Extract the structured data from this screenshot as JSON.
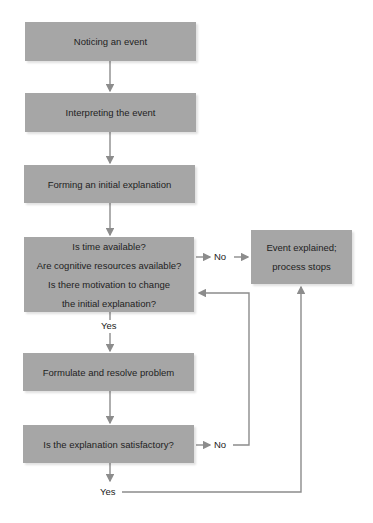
{
  "diagram": {
    "type": "flowchart",
    "nodes": {
      "notice": "Noticing an event",
      "interpret": "Interpreting the event",
      "initial": "Forming an initial explanation",
      "decision": [
        "Is time available?",
        "Are cognitive resources available?",
        "Is there motivation to change",
        "the initial explanation?"
      ],
      "formulate": "Formulate and resolve problem",
      "satisfactory": "Is the explanation satisfactory?",
      "explained": [
        "Event explained;",
        "process stops"
      ]
    },
    "labels": {
      "decision_no": "No",
      "decision_yes": "Yes",
      "satisfactory_no": "No",
      "satisfactory_yes": "Yes"
    },
    "colors": {
      "box_fill": "#a6a6a6",
      "arrow": "#8c8c8c"
    }
  }
}
